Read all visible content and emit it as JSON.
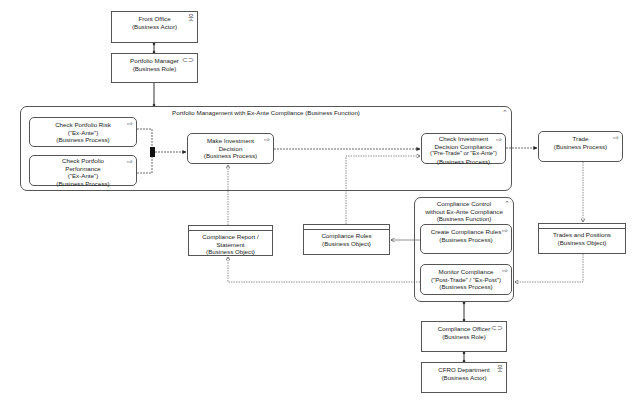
{
  "diagram": {
    "front_office": {
      "title": "Front Office",
      "type": "(Business Actor)",
      "icon": "actor-icon"
    },
    "portfolio_manager": {
      "title": "Portfolio Manager",
      "type": "(Business Role)",
      "icon": "role-icon"
    },
    "portfolio_function": {
      "title": "Portfolio Management with Ex-Ante Compliance (Business Function)",
      "icon": "function-icon"
    },
    "check_risk": {
      "line1": "Check Portfolio Risk",
      "line2": "(\"Ex-Ante\")",
      "type": "(Business Process)",
      "icon": "process-icon"
    },
    "check_performance": {
      "line1": "Check Portfolio",
      "line2": "Performance",
      "line3": "(\"Ex-Ante\")",
      "type": "(Business Process)",
      "icon": "process-icon"
    },
    "make_decision": {
      "line1": "Make Investment",
      "line2": "Decision",
      "type": "(Business Process)",
      "icon": "process-icon"
    },
    "check_compliance": {
      "line1": "Check Investment",
      "line2": "Decision Compliance",
      "line3": "(\"Pre-Trade\" or \"Ex-Ante\")",
      "type": "(Business Process)",
      "icon": "process-icon"
    },
    "trade": {
      "title": "Trade",
      "type": "(Business Process)",
      "icon": "process-icon"
    },
    "compliance_report": {
      "title": "Compliance Report / Statement",
      "type": "(Business Object)"
    },
    "compliance_rules": {
      "title": "Compliance Rules",
      "type": "(Business Object)"
    },
    "compliance_control": {
      "line1": "Compliance Control",
      "line2": "without Ex-Ante Compliance",
      "type": "(Business Function)",
      "icon": "function-icon"
    },
    "create_rules": {
      "title": "Create Compliance Rules",
      "type": "(Business Process)",
      "icon": "process-icon"
    },
    "monitor": {
      "line1": "Monitor Compliance",
      "line2": "(\"Post-Trade\" / \"Ex-Post\")",
      "type": "(Business Process)",
      "icon": "process-icon"
    },
    "trades_positions": {
      "title": "Trades and Positions",
      "type": "(Business Object)"
    },
    "compliance_officer": {
      "title": "Compliance Officer",
      "type": "(Business Role)",
      "icon": "role-icon"
    },
    "cfro": {
      "title": "CFRO Department",
      "type": "(Business Actor)",
      "icon": "actor-icon"
    }
  },
  "icons": {
    "actor": "웃",
    "role": "⊂⊃",
    "process": "⇨",
    "function": "⌃"
  },
  "colors": {
    "line": "#555555",
    "background": "#ffffff"
  }
}
